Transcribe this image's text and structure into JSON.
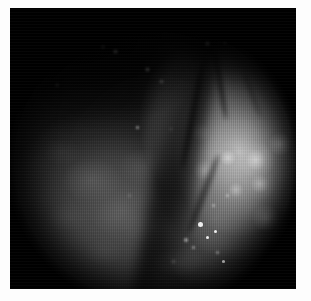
{
  "viewer": {
    "title": "Endoscopic Image Viewer",
    "caption": "",
    "border_color": "#fdfdfd",
    "canvas_background": "#000000",
    "modality": "endoscopy",
    "color_mode": "grayscale"
  },
  "image": {
    "name": "endoscopic-frame",
    "width": 286,
    "height": 281,
    "field_of_view": "circular",
    "regions": [
      {
        "name": "dark-tissue-region",
        "description": "Dimly lit mottled mucosal surface occupying the lower-left of the circular field of view",
        "brightness": "low",
        "center": [
          118,
          198
        ]
      },
      {
        "name": "bright-lesion-region",
        "description": "Strongly illuminated nodular tissue mass occupying the right portion of the field of view",
        "brightness": "high",
        "center": [
          235,
          140
        ]
      },
      {
        "name": "shadow-valley",
        "description": "Dark diagonal groove separating the dark mucosa from the illuminated lesion",
        "brightness": "very-low"
      },
      {
        "name": "upper-shadow-region",
        "description": "Deep unlit shadow across the upper-left of the frame",
        "brightness": "very-low"
      }
    ],
    "grooves": [
      {
        "name": "mucosal-fold-a",
        "orientation": "near-vertical"
      },
      {
        "name": "mucosal-fold-b",
        "orientation": "diagonal"
      },
      {
        "name": "mucosal-fold-c",
        "orientation": "diagonal"
      },
      {
        "name": "mucosal-fold-d",
        "orientation": "diagonal"
      }
    ],
    "specular_highlights": [
      {
        "name": "specular-1",
        "x": 188,
        "y": 214,
        "size": 5
      },
      {
        "name": "specular-2",
        "x": 196,
        "y": 228,
        "size": 3
      },
      {
        "name": "specular-3",
        "x": 204,
        "y": 222,
        "size": 3
      },
      {
        "name": "specular-4",
        "x": 174,
        "y": 230,
        "size": 3
      },
      {
        "name": "specular-5",
        "x": 182,
        "y": 238,
        "size": 2
      },
      {
        "name": "specular-6",
        "x": 206,
        "y": 243,
        "size": 2
      },
      {
        "name": "specular-7",
        "x": 212,
        "y": 252,
        "size": 3
      },
      {
        "name": "specular-8",
        "x": 202,
        "y": 196,
        "size": 2
      },
      {
        "name": "specular-9",
        "x": 216,
        "y": 186,
        "size": 2
      },
      {
        "name": "specular-10",
        "x": 162,
        "y": 252,
        "size": 2
      },
      {
        "name": "specular-11",
        "x": 126,
        "y": 118,
        "size": 2
      },
      {
        "name": "specular-12",
        "x": 136,
        "y": 60,
        "size": 2
      },
      {
        "name": "specular-13",
        "x": 104,
        "y": 42,
        "size": 2
      },
      {
        "name": "specular-14",
        "x": 92,
        "y": 38,
        "size": 2
      },
      {
        "name": "specular-15",
        "x": 150,
        "y": 72,
        "size": 2
      },
      {
        "name": "specular-16",
        "x": 196,
        "y": 34,
        "size": 2
      },
      {
        "name": "specular-17",
        "x": 46,
        "y": 76,
        "size": 2
      },
      {
        "name": "specular-18",
        "x": 118,
        "y": 186,
        "size": 2
      },
      {
        "name": "specular-19",
        "x": 214,
        "y": 34,
        "size": 2
      },
      {
        "name": "specular-20",
        "x": 160,
        "y": 120,
        "size": 2
      }
    ],
    "texture": {
      "scanlines": "vertical",
      "grain": "fine"
    }
  }
}
